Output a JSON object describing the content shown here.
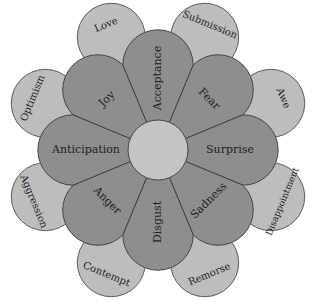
{
  "diagram": {
    "type": "wheel-of-emotions",
    "center": {
      "x": 158,
      "y": 150,
      "r": 30
    },
    "colors": {
      "inner": "#8e8e8e",
      "outer": "#bdbdbd",
      "center": "#c4c4c4",
      "stroke": "#3a3a3a"
    },
    "primary_emotions": [
      {
        "label": "Acceptance",
        "angle": 0
      },
      {
        "label": "Fear",
        "angle": 45
      },
      {
        "label": "Surprise",
        "angle": 90
      },
      {
        "label": "Sadness",
        "angle": 135
      },
      {
        "label": "Disgust",
        "angle": 180
      },
      {
        "label": "Anger",
        "angle": 225
      },
      {
        "label": "Anticipation",
        "angle": 270
      },
      {
        "label": "Joy",
        "angle": 315
      }
    ],
    "dyads": [
      {
        "label": "Submission",
        "angle": 22.5
      },
      {
        "label": "Awe",
        "angle": 67.5
      },
      {
        "label": "Disappointment",
        "angle": 112.5
      },
      {
        "label": "Remorse",
        "angle": 157.5
      },
      {
        "label": "Contempt",
        "angle": 202.5
      },
      {
        "label": "Aggression",
        "angle": 247.5
      },
      {
        "label": "Optimism",
        "angle": 292.5
      },
      {
        "label": "Love",
        "angle": 337.5
      }
    ]
  }
}
